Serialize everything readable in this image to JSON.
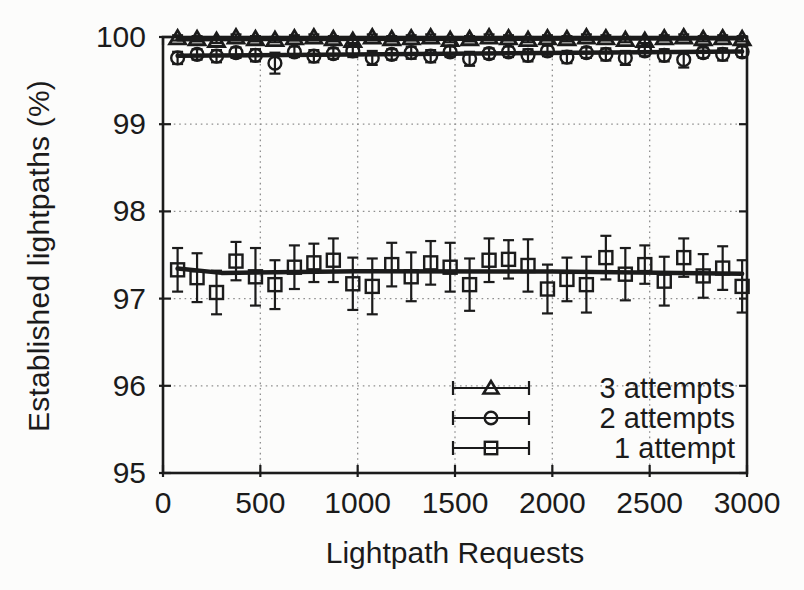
{
  "figure": {
    "background": "#fcfcfb",
    "ink_color": "#1b1b1b",
    "grid_color": "#8f8f8f"
  },
  "chart_data": {
    "type": "scatter",
    "title": "",
    "xlabel": "Lightpath Requests",
    "ylabel": "Established lightpaths (%)",
    "xlim": [
      0,
      3000
    ],
    "ylim": [
      95,
      100
    ],
    "xticks": [
      0,
      500,
      1000,
      1500,
      2000,
      2500,
      3000
    ],
    "yticks": [
      95,
      96,
      97,
      98,
      99,
      100
    ],
    "grid": "dotted",
    "legend_position": "inside-bottom-right",
    "x": [
      75,
      175,
      275,
      375,
      475,
      575,
      675,
      775,
      875,
      975,
      1075,
      1175,
      1275,
      1375,
      1475,
      1575,
      1675,
      1775,
      1875,
      1975,
      2075,
      2175,
      2275,
      2375,
      2475,
      2575,
      2675,
      2775,
      2875,
      2975
    ],
    "series": [
      {
        "name": "3 attempts",
        "marker": "triangle",
        "values": [
          99.99,
          99.98,
          99.96,
          100.0,
          99.98,
          99.97,
          99.99,
          100.0,
          99.98,
          99.96,
          100.0,
          99.98,
          99.99,
          100.0,
          99.97,
          99.98,
          100.0,
          99.99,
          99.97,
          99.99,
          99.98,
          100.0,
          99.99,
          99.97,
          99.96,
          99.99,
          100.0,
          99.98,
          99.99,
          99.98
        ],
        "errors": [
          0.03,
          0.03,
          0.03,
          0.03,
          0.03,
          0.03,
          0.03,
          0.03,
          0.03,
          0.03,
          0.03,
          0.03,
          0.03,
          0.03,
          0.03,
          0.03,
          0.03,
          0.03,
          0.03,
          0.03,
          0.03,
          0.03,
          0.03,
          0.03,
          0.03,
          0.03,
          0.03,
          0.03,
          0.03,
          0.03
        ],
        "trend": [
          [
            75,
            99.975
          ],
          [
            2975,
            99.985
          ]
        ]
      },
      {
        "name": "2 attempts",
        "marker": "circle",
        "values": [
          99.76,
          99.8,
          99.78,
          99.82,
          99.79,
          99.7,
          99.83,
          99.78,
          99.81,
          99.84,
          99.76,
          99.8,
          99.82,
          99.78,
          99.83,
          99.75,
          99.81,
          99.83,
          99.79,
          99.84,
          99.77,
          99.82,
          99.8,
          99.76,
          99.84,
          99.79,
          99.74,
          99.82,
          99.8,
          99.83
        ],
        "errors": [
          0.07,
          0.06,
          0.07,
          0.06,
          0.07,
          0.12,
          0.06,
          0.07,
          0.06,
          0.07,
          0.08,
          0.06,
          0.07,
          0.07,
          0.06,
          0.08,
          0.06,
          0.06,
          0.07,
          0.06,
          0.07,
          0.06,
          0.07,
          0.08,
          0.06,
          0.07,
          0.09,
          0.06,
          0.07,
          0.06
        ],
        "trend": [
          [
            75,
            99.785
          ],
          [
            2975,
            99.835
          ]
        ]
      },
      {
        "name": "1 attempt",
        "marker": "square",
        "values": [
          97.33,
          97.24,
          97.07,
          97.43,
          97.25,
          97.16,
          97.36,
          97.41,
          97.44,
          97.17,
          97.14,
          97.39,
          97.25,
          97.41,
          97.36,
          97.16,
          97.44,
          97.45,
          97.38,
          97.11,
          97.22,
          97.16,
          97.47,
          97.28,
          97.39,
          97.2,
          97.47,
          97.26,
          97.35,
          97.14
        ],
        "errors": [
          0.25,
          0.28,
          0.25,
          0.22,
          0.33,
          0.28,
          0.25,
          0.22,
          0.25,
          0.3,
          0.32,
          0.25,
          0.28,
          0.25,
          0.28,
          0.3,
          0.25,
          0.22,
          0.3,
          0.28,
          0.25,
          0.32,
          0.25,
          0.3,
          0.22,
          0.28,
          0.22,
          0.25,
          0.25,
          0.3
        ],
        "trend": [
          [
            75,
            97.345
          ],
          [
            300,
            97.295
          ],
          [
            1000,
            97.315
          ],
          [
            2000,
            97.31
          ],
          [
            2975,
            97.285
          ]
        ]
      }
    ]
  }
}
